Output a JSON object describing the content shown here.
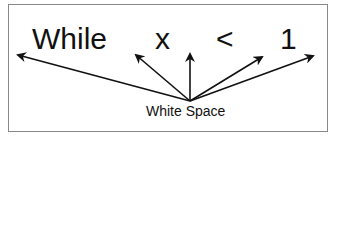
{
  "diagram": {
    "tokens": [
      "While",
      "x",
      "<",
      "1"
    ],
    "label": "White Space",
    "colors": {
      "border": "#888888",
      "ink": "#111111"
    }
  }
}
